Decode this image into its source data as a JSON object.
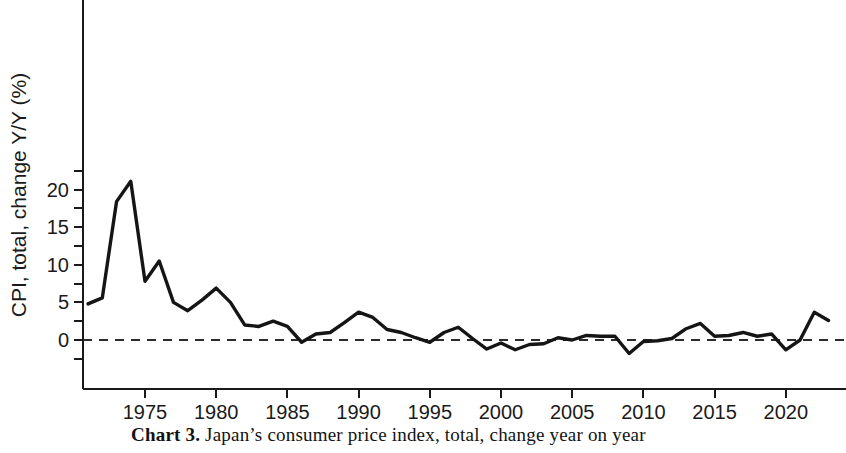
{
  "figure": {
    "caption_label": "Chart 3.",
    "caption_text": "Japan’s consumer price index, total, change year on year"
  },
  "chart_data": {
    "type": "line",
    "title": "",
    "subtitle": "",
    "xlabel": "",
    "ylabel": "CPI, total, change Y/Y (%)",
    "xlim": [
      1970.6,
      2023.6
    ],
    "ylim": [
      -3.1,
      22.3
    ],
    "grid": false,
    "legend": "none",
    "zero_reference_line": {
      "value": 0,
      "style": "dashed"
    },
    "x_tick_labels": [
      "1975",
      "1980",
      "1985",
      "1990",
      "1995",
      "2000",
      "2005",
      "2010",
      "2015",
      "2020"
    ],
    "x_ticks": [
      1975,
      1980,
      1985,
      1990,
      1995,
      2000,
      2005,
      2010,
      2015,
      2020
    ],
    "y_tick_labels": [
      "0",
      "5",
      "10",
      "15",
      "20"
    ],
    "y_ticks": [
      0,
      5,
      10,
      15,
      20
    ],
    "y_minor_ticks": [
      -2.5,
      2.5,
      7.5,
      12.5,
      17.5,
      22.5
    ],
    "line_color": "#151515",
    "series": [
      {
        "name": "CPI, total, change Y/Y (%)",
        "x": [
          1971,
          1972,
          1973,
          1974,
          1975,
          1976,
          1977,
          1978,
          1979,
          1980,
          1981,
          1982,
          1983,
          1984,
          1985,
          1986,
          1987,
          1988,
          1989,
          1990,
          1991,
          1992,
          1993,
          1994,
          1995,
          1996,
          1997,
          1998,
          1999,
          2000,
          2001,
          2002,
          2003,
          2004,
          2005,
          2006,
          2007,
          2008,
          2009,
          2010,
          2011,
          2012,
          2013,
          2014,
          2015,
          2016,
          2017,
          2018,
          2019,
          2020,
          2021,
          2022,
          2023
        ],
        "values": [
          4.8,
          5.6,
          18.4,
          21.1,
          7.8,
          10.5,
          5.0,
          3.9,
          5.3,
          6.9,
          5.0,
          2.0,
          1.8,
          2.5,
          1.8,
          -0.3,
          0.8,
          1.0,
          2.3,
          3.7,
          3.0,
          1.4,
          1.0,
          0.3,
          -0.3,
          1.0,
          1.7,
          0.2,
          -1.2,
          -0.4,
          -1.3,
          -0.6,
          -0.5,
          0.3,
          0.0,
          0.6,
          0.5,
          0.5,
          -1.8,
          -0.2,
          -0.1,
          0.2,
          1.5,
          2.2,
          0.5,
          0.6,
          1.0,
          0.5,
          0.8,
          -1.3,
          0.0,
          3.7,
          2.6
        ]
      }
    ]
  }
}
